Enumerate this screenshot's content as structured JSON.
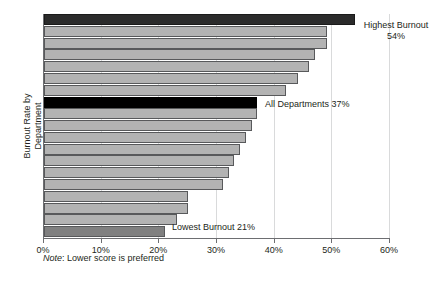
{
  "chart_data": {
    "type": "bar",
    "orientation": "horizontal",
    "title": "",
    "xlabel": "",
    "ylabel": "Burnout Rate by\nDepartment",
    "xlim": [
      0,
      60
    ],
    "x_tick_labels": [
      "0%",
      "10%",
      "20%",
      "30%",
      "40%",
      "50%",
      "60%"
    ],
    "x_tick_values": [
      0,
      10,
      20,
      30,
      40,
      50,
      60
    ],
    "grid": "vertical-light",
    "legend": "none",
    "note": {
      "word": "Note",
      "rest": ": Lower score is preferred"
    },
    "categories": [
      "bar-1",
      "bar-2",
      "bar-3",
      "bar-4",
      "bar-5",
      "bar-6",
      "bar-7",
      "bar-8",
      "bar-9",
      "bar-10",
      "bar-11",
      "bar-12",
      "bar-13",
      "bar-14",
      "bar-15",
      "bar-16",
      "bar-17",
      "bar-18",
      "bar-19"
    ],
    "values": [
      54,
      49,
      49,
      47,
      46,
      44,
      42,
      37,
      37,
      36,
      35,
      34,
      33,
      32,
      31,
      25,
      25,
      23,
      21
    ],
    "bar_styles": [
      "highest",
      "normal",
      "normal",
      "normal",
      "normal",
      "normal",
      "normal",
      "average",
      "normal",
      "normal",
      "normal",
      "normal",
      "normal",
      "normal",
      "normal",
      "normal",
      "normal",
      "normal",
      "lowest"
    ],
    "annotations": [
      {
        "id": "highest",
        "text": "Highest Burnout\n54%",
        "value": 54,
        "bar_index": 0
      },
      {
        "id": "average",
        "text": "All Departments 37%",
        "value": 37,
        "bar_index": 7
      },
      {
        "id": "lowest",
        "text": "Lowest Burnout 21%",
        "value": 21,
        "bar_index": 18
      }
    ],
    "colors": {
      "bar_normal": "#b3b3b3",
      "bar_highest": "#2b2b2b",
      "bar_average": "#000000",
      "bar_lowest": "#808080",
      "bar_border": "#58595b",
      "axis": "#6d6e71",
      "gridline": "#d9dadb",
      "text": "#231f20",
      "background": "#ffffff"
    }
  }
}
